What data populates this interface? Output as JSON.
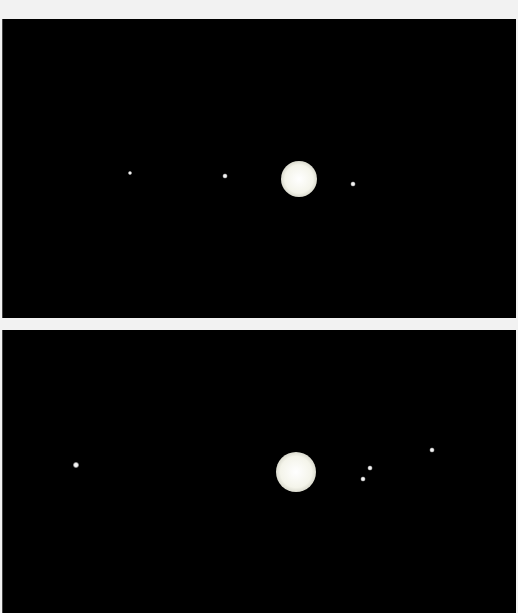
{
  "image": {
    "description": "Two telescope frames of a planet with small moons on black sky",
    "background_color": "#000000",
    "frame_gap_color": "#f2f2f2"
  },
  "frames": [
    {
      "name": "top-frame",
      "planet": {
        "x": 296,
        "y": 160,
        "diameter": 36
      },
      "moons": [
        {
          "x": 127,
          "y": 154,
          "size": 4
        },
        {
          "x": 222,
          "y": 157,
          "size": 5
        },
        {
          "x": 350,
          "y": 165,
          "size": 5
        }
      ]
    },
    {
      "name": "bottom-frame",
      "planet": {
        "x": 293,
        "y": 142,
        "diameter": 40
      },
      "moons": [
        {
          "x": 73,
          "y": 135,
          "size": 6
        },
        {
          "x": 360,
          "y": 149,
          "size": 5
        },
        {
          "x": 367,
          "y": 138,
          "size": 5
        },
        {
          "x": 429,
          "y": 120,
          "size": 5
        }
      ]
    }
  ]
}
